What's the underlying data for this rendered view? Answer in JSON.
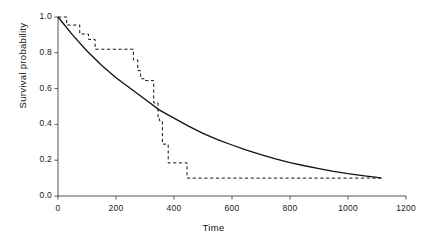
{
  "chart_data": {
    "type": "line",
    "title": "",
    "xlabel": "Time",
    "ylabel": "Survival probability",
    "xlim": [
      0,
      1200
    ],
    "ylim": [
      0.0,
      1.0
    ],
    "grid": false,
    "legend": "none",
    "xticks": [
      0,
      200,
      400,
      600,
      800,
      1000,
      1200
    ],
    "xtick_labels": [
      "0",
      "200",
      "400",
      "600",
      "800",
      "1000",
      "1200"
    ],
    "yticks": [
      0.0,
      0.2,
      0.4,
      0.6,
      0.8,
      1.0
    ],
    "ytick_labels": [
      "0.0",
      "0.2",
      "0.4",
      "0.6",
      "0.8",
      "1.0"
    ],
    "series": [
      {
        "name": "fitted-exponential-survival",
        "style": "solid",
        "color": "#111111",
        "x": [
          0,
          50,
          100,
          150,
          200,
          250,
          300,
          350,
          400,
          450,
          500,
          550,
          600,
          650,
          700,
          750,
          800,
          850,
          900,
          950,
          1000,
          1050,
          1100,
          1115
        ],
        "y": [
          1.0,
          0.9,
          0.81,
          0.73,
          0.66,
          0.6,
          0.54,
          0.48,
          0.435,
          0.39,
          0.35,
          0.315,
          0.285,
          0.256,
          0.231,
          0.208,
          0.187,
          0.169,
          0.153,
          0.138,
          0.125,
          0.114,
          0.104,
          0.1
        ]
      },
      {
        "name": "kaplan-meier-step-survival",
        "style": "dashed",
        "color": "#111111",
        "x": [
          0,
          30,
          30,
          75,
          75,
          105,
          105,
          128,
          128,
          150,
          150,
          190,
          190,
          215,
          215,
          260,
          260,
          275,
          275,
          285,
          285,
          300,
          300,
          310,
          310,
          330,
          330,
          345,
          345,
          350,
          350,
          360,
          360,
          380,
          380,
          440,
          440,
          445,
          445,
          1115
        ],
        "y": [
          1.0,
          1.0,
          0.955,
          0.955,
          0.905,
          0.905,
          0.875,
          0.875,
          0.82,
          0.82,
          0.82,
          0.82,
          0.82,
          0.82,
          0.82,
          0.82,
          0.76,
          0.76,
          0.7,
          0.7,
          0.655,
          0.655,
          0.645,
          0.645,
          0.645,
          0.645,
          0.52,
          0.52,
          0.44,
          0.44,
          0.42,
          0.42,
          0.29,
          0.29,
          0.185,
          0.185,
          0.185,
          0.185,
          0.1,
          0.1
        ]
      }
    ],
    "annotations": []
  },
  "geometry": {
    "plot_left": 58,
    "plot_right": 406,
    "plot_top": 17,
    "plot_bottom": 196
  }
}
